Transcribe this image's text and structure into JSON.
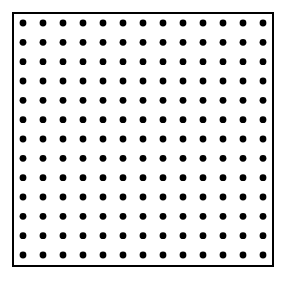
{
  "diagram": {
    "type": "dot-grid",
    "rows": 13,
    "columns": 13,
    "dot_color": "#000000",
    "border_color": "#000000",
    "background_color": "#ffffff"
  }
}
